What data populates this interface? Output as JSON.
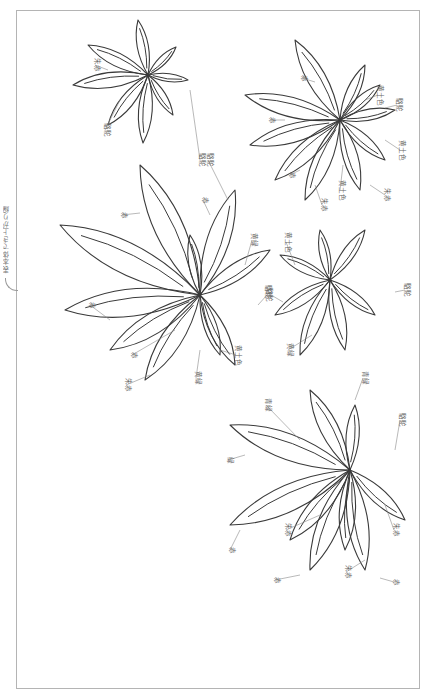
{
  "diagram": {
    "side_label": "表本体でき上がり線",
    "flowers": [
      {
        "id": "flower-top-left",
        "center": [
          148,
          75
        ],
        "petals": [
          [
            -60,
            -30
          ],
          [
            -75,
            10
          ],
          [
            -40,
            50
          ],
          [
            -5,
            68
          ],
          [
            25,
            40
          ],
          [
            -10,
            -55
          ],
          [
            28,
            -28
          ],
          [
            40,
            5
          ]
        ],
        "labels": [
          {
            "text": "朱赤",
            "x": 95,
            "y": 65,
            "tx": 108,
            "ty": 70
          },
          {
            "text": "駱駝",
            "x": 105,
            "y": 130,
            "tx": 120,
            "ty": 100
          },
          {
            "text": "駱駝",
            "x": 200,
            "y": 160,
            "tx": 190,
            "ty": 90
          }
        ]
      },
      {
        "id": "flower-top-right",
        "center": [
          340,
          120
        ],
        "petals": [
          [
            -45,
            -80
          ],
          [
            -95,
            -25
          ],
          [
            -90,
            25
          ],
          [
            -65,
            60
          ],
          [
            -35,
            80
          ],
          [
            20,
            70
          ],
          [
            45,
            40
          ],
          [
            25,
            -55
          ],
          [
            40,
            -35
          ],
          [
            55,
            -10
          ]
        ],
        "labels": [
          {
            "text": "赤",
            "x": 302,
            "y": 78,
            "tx": 315,
            "ty": 82
          },
          {
            "text": "赤",
            "x": 270,
            "y": 120,
            "tx": 285,
            "ty": 120
          },
          {
            "text": "赤",
            "x": 290,
            "y": 175,
            "tx": 300,
            "ty": 170
          },
          {
            "text": "黄土色",
            "x": 378,
            "y": 95,
            "tx": 365,
            "ty": 100
          },
          {
            "text": "駱駝",
            "x": 397,
            "y": 105,
            "tx": 385,
            "ty": 108
          },
          {
            "text": "黄土色",
            "x": 400,
            "y": 150,
            "tx": 385,
            "ty": 140
          },
          {
            "text": "黄土色",
            "x": 340,
            "y": 190,
            "tx": 343,
            "ty": 165
          },
          {
            "text": "朱赤",
            "x": 322,
            "y": 205,
            "tx": 315,
            "ty": 185
          },
          {
            "text": "朱赤",
            "x": 385,
            "y": 195,
            "tx": 370,
            "ty": 185
          }
        ]
      },
      {
        "id": "flower-middle-left",
        "center": [
          200,
          295
        ],
        "petals": [
          [
            -60,
            -130
          ],
          [
            -140,
            -70
          ],
          [
            -135,
            15
          ],
          [
            -90,
            55
          ],
          [
            -55,
            85
          ],
          [
            -10,
            -60
          ],
          [
            35,
            -105
          ],
          [
            70,
            -45
          ],
          [
            20,
            60
          ],
          [
            35,
            70
          ]
        ],
        "labels": [
          {
            "text": "赤",
            "x": 122,
            "y": 215,
            "tx": 140,
            "ty": 213
          },
          {
            "text": "赤",
            "x": 203,
            "y": 200,
            "tx": 210,
            "ty": 215
          },
          {
            "text": "駱駝",
            "x": 208,
            "y": 160,
            "tx": 228,
            "ty": 200
          },
          {
            "text": "黄緑",
            "x": 252,
            "y": 240,
            "tx": 245,
            "ty": 265
          },
          {
            "text": "駱駝",
            "x": 267,
            "y": 295,
            "tx": 258,
            "ty": 305
          },
          {
            "text": "赤",
            "x": 90,
            "y": 305,
            "tx": 110,
            "ty": 320
          },
          {
            "text": "赤",
            "x": 132,
            "y": 355,
            "tx": 175,
            "ty": 330
          },
          {
            "text": "朱赤",
            "x": 126,
            "y": 385,
            "tx": 150,
            "ty": 375
          },
          {
            "text": "黄緑",
            "x": 196,
            "y": 378,
            "tx": 200,
            "ty": 350
          },
          {
            "text": "黄土色",
            "x": 236,
            "y": 355,
            "tx": 220,
            "ty": 350
          }
        ]
      },
      {
        "id": "flower-middle-right",
        "center": [
          330,
          280
        ],
        "petals": [
          [
            -50,
            -25
          ],
          [
            -55,
            35
          ],
          [
            -30,
            75
          ],
          [
            -10,
            -50
          ],
          [
            35,
            -50
          ],
          [
            45,
            35
          ],
          [
            15,
            70
          ]
        ],
        "labels": [
          {
            "text": "黄土色",
            "x": 286,
            "y": 242,
            "tx": 295,
            "ty": 265
          },
          {
            "text": "駱駝",
            "x": 405,
            "y": 290,
            "tx": 395,
            "ty": 292
          },
          {
            "text": "駱駝",
            "x": 266,
            "y": 292,
            "tx": 283,
            "ty": 302
          },
          {
            "text": "黄緑",
            "x": 288,
            "y": 350,
            "tx": 312,
            "ty": 335
          }
        ]
      },
      {
        "id": "flower-bottom",
        "center": [
          350,
          470
        ],
        "petals": [
          [
            -40,
            -80
          ],
          [
            5,
            -65
          ],
          [
            -120,
            -45
          ],
          [
            -120,
            55
          ],
          [
            -60,
            70
          ],
          [
            -40,
            100
          ],
          [
            15,
            100
          ],
          [
            55,
            50
          ],
          [
            -5,
            80
          ]
        ],
        "labels": [
          {
            "text": "青緑",
            "x": 363,
            "y": 378,
            "tx": 355,
            "ty": 400
          },
          {
            "text": "青緑",
            "x": 266,
            "y": 405,
            "tx": 300,
            "ty": 440
          },
          {
            "text": "緑",
            "x": 228,
            "y": 460,
            "tx": 245,
            "ty": 455
          },
          {
            "text": "駱駝",
            "x": 400,
            "y": 420,
            "tx": 395,
            "ty": 450
          },
          {
            "text": "赤",
            "x": 230,
            "y": 550,
            "tx": 240,
            "ty": 530
          },
          {
            "text": "朱赤",
            "x": 286,
            "y": 530,
            "tx": 320,
            "ty": 515
          },
          {
            "text": "朱赤",
            "x": 394,
            "y": 530,
            "tx": 385,
            "ty": 505
          },
          {
            "text": "赤",
            "x": 275,
            "y": 580,
            "tx": 300,
            "ty": 575
          },
          {
            "text": "朱赤",
            "x": 346,
            "y": 572,
            "tx": 365,
            "ty": 560
          },
          {
            "text": "赤",
            "x": 394,
            "y": 582,
            "tx": 380,
            "ty": 578
          }
        ]
      }
    ]
  }
}
